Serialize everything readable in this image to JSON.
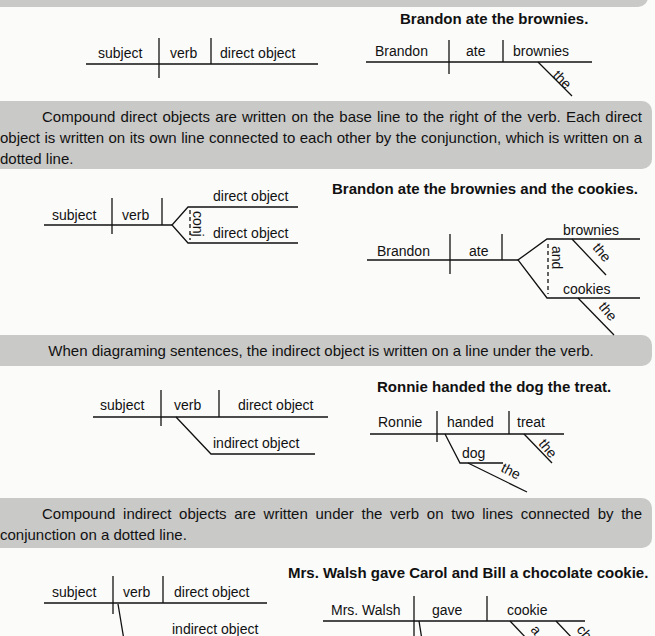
{
  "sections": [
    {
      "id": "direct-object",
      "description": "",
      "template": {
        "subject": "subject",
        "verb": "verb",
        "direct_object": "direct object"
      },
      "example": {
        "sentence": "Brandon ate the brownies.",
        "subject": "Brandon",
        "verb": "ate",
        "direct_object": "brownies",
        "modifier": "the"
      }
    },
    {
      "id": "compound-direct-object",
      "description": "Compound direct objects are written on the base line to the right of the verb. Each direct object is written on its own line connected to each other by the conjunction, which is written on a dotted line.",
      "template": {
        "subject": "subject",
        "verb": "verb",
        "direct_object_1": "direct object",
        "direct_object_2": "direct object",
        "conjunction": "conj"
      },
      "example": {
        "sentence": "Brandon ate the brownies and the cookies.",
        "subject": "Brandon",
        "verb": "ate",
        "direct_object_1": "brownies",
        "modifier_1": "the",
        "direct_object_2": "cookies",
        "modifier_2": "the",
        "conjunction": "and"
      }
    },
    {
      "id": "indirect-object",
      "description": "When diagraming sentences, the indirect object is written on a line under the verb.",
      "template": {
        "subject": "subject",
        "verb": "verb",
        "direct_object": "direct object",
        "indirect_object": "indirect object"
      },
      "example": {
        "sentence": "Ronnie handed the dog the treat.",
        "subject": "Ronnie",
        "verb": "handed",
        "direct_object": "treat",
        "direct_modifier": "the",
        "indirect_object": "dog",
        "indirect_modifier": "the"
      }
    },
    {
      "id": "compound-indirect-object",
      "description": "Compound indirect objects are written under the verb on two lines connected by the conjunction on a dotted line.",
      "template": {
        "subject": "subject",
        "verb": "verb",
        "direct_object": "direct object",
        "indirect_object": "indirect object"
      },
      "example": {
        "sentence": "Mrs. Walsh gave Carol and Bill a chocolate cookie.",
        "subject": "Mrs. Walsh",
        "verb": "gave",
        "direct_object": "cookie",
        "modifier_1": "a",
        "modifier_2": "ch"
      }
    }
  ]
}
